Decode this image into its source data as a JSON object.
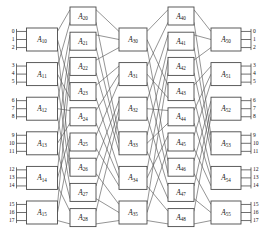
{
  "diagram": {
    "kind": "multistage-switching-network",
    "stage_count": 5,
    "stages": [
      {
        "name": "stage-1",
        "switches": [
          "A10",
          "A11",
          "A12",
          "A13",
          "A14",
          "A15"
        ],
        "labels": [
          {
            "base": "A",
            "sub": "10"
          },
          {
            "base": "A",
            "sub": "11"
          },
          {
            "base": "A",
            "sub": "12"
          },
          {
            "base": "A",
            "sub": "13"
          },
          {
            "base": "A",
            "sub": "14"
          },
          {
            "base": "A",
            "sub": "15"
          }
        ]
      },
      {
        "name": "stage-2",
        "switches": [
          "A20",
          "A21",
          "A22",
          "A23",
          "A24",
          "A25",
          "A26",
          "A27",
          "A28"
        ],
        "labels": [
          {
            "base": "A",
            "sub": "20"
          },
          {
            "base": "A",
            "sub": "21"
          },
          {
            "base": "A",
            "sub": "22"
          },
          {
            "base": "A",
            "sub": "23"
          },
          {
            "base": "A",
            "sub": "24"
          },
          {
            "base": "A",
            "sub": "25"
          },
          {
            "base": "A",
            "sub": "26"
          },
          {
            "base": "A",
            "sub": "27"
          },
          {
            "base": "A",
            "sub": "28"
          }
        ]
      },
      {
        "name": "stage-3",
        "switches": [
          "A30",
          "A31",
          "A32",
          "A33",
          "A34",
          "A35"
        ],
        "labels": [
          {
            "base": "A",
            "sub": "30"
          },
          {
            "base": "A",
            "sub": "31"
          },
          {
            "base": "A",
            "sub": "32"
          },
          {
            "base": "A",
            "sub": "33"
          },
          {
            "base": "A",
            "sub": "34"
          },
          {
            "base": "A",
            "sub": "35"
          }
        ]
      },
      {
        "name": "stage-4",
        "switches": [
          "A40",
          "A41",
          "A42",
          "A43",
          "A44",
          "A45",
          "A46",
          "A47",
          "A48"
        ],
        "labels": [
          {
            "base": "A",
            "sub": "40"
          },
          {
            "base": "A",
            "sub": "41"
          },
          {
            "base": "A",
            "sub": "42"
          },
          {
            "base": "A",
            "sub": "43"
          },
          {
            "base": "A",
            "sub": "44"
          },
          {
            "base": "A",
            "sub": "45"
          },
          {
            "base": "A",
            "sub": "46"
          },
          {
            "base": "A",
            "sub": "47"
          },
          {
            "base": "A",
            "sub": "48"
          }
        ]
      },
      {
        "name": "stage-5",
        "switches": [
          "A50",
          "A51",
          "A52",
          "A53",
          "A54",
          "A55"
        ],
        "labels": [
          {
            "base": "A",
            "sub": "50"
          },
          {
            "base": "A",
            "sub": "51"
          },
          {
            "base": "A",
            "sub": "52"
          },
          {
            "base": "A",
            "sub": "53"
          },
          {
            "base": "A",
            "sub": "54"
          },
          {
            "base": "A",
            "sub": "55"
          }
        ]
      }
    ],
    "input_ports": [
      "0",
      "1",
      "2",
      "3",
      "4",
      "5",
      "6",
      "7",
      "8",
      "9",
      "10",
      "11",
      "12",
      "13",
      "14",
      "15",
      "16",
      "17"
    ],
    "output_ports": [
      "0",
      "1",
      "2",
      "3",
      "4",
      "5",
      "6",
      "7",
      "8",
      "9",
      "10",
      "11",
      "12",
      "13",
      "14",
      "15",
      "16",
      "17"
    ],
    "ports_per_switch": 3,
    "colors": {
      "box_stroke": "#4a4a4a",
      "link_stroke": "#5a5a5a",
      "text": "#151515",
      "background": "#ffffff"
    }
  }
}
